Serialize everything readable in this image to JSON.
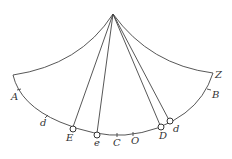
{
  "diagram": {
    "apex": [
      113,
      14
    ],
    "labels": {
      "A": "A",
      "d_left": "d",
      "E": "E",
      "e": "e",
      "C": "C",
      "O": "O",
      "D": "D",
      "d_right": "d",
      "B": "B",
      "Z": "Z"
    },
    "bobs": [
      "E",
      "e",
      "D",
      "d"
    ],
    "ticks": [
      "A",
      "d",
      "C",
      "O",
      "B"
    ]
  }
}
